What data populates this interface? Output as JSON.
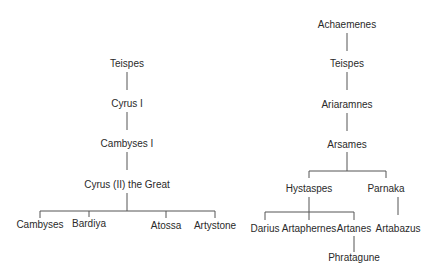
{
  "diagram": {
    "type": "family-tree",
    "left_tree": {
      "nodes": [
        {
          "id": "teispes_l",
          "label": "Teispes",
          "x": 127,
          "y": 64
        },
        {
          "id": "cyrus1",
          "label": "Cyrus I",
          "x": 127,
          "y": 104
        },
        {
          "id": "cambyses1",
          "label": "Cambyses I",
          "x": 127,
          "y": 144
        },
        {
          "id": "cyrus2",
          "label": "Cyrus (II) the Great",
          "x": 127,
          "y": 185
        },
        {
          "id": "cambyses",
          "label": "Cambyses",
          "x": 40,
          "y": 225
        },
        {
          "id": "bardiya",
          "label": "Bardiya",
          "x": 89,
          "y": 224
        },
        {
          "id": "atossa",
          "label": "Atossa",
          "x": 166,
          "y": 226
        },
        {
          "id": "artystone",
          "label": "Artystone",
          "x": 215,
          "y": 226
        }
      ]
    },
    "right_tree": {
      "nodes": [
        {
          "id": "achaemenes",
          "label": "Achaemenes",
          "x": 347,
          "y": 25
        },
        {
          "id": "teispes_r",
          "label": "Teispes",
          "x": 347,
          "y": 64
        },
        {
          "id": "ariaramnes",
          "label": "Ariaramnes",
          "x": 347,
          "y": 105
        },
        {
          "id": "arsames",
          "label": "Arsames",
          "x": 347,
          "y": 145
        },
        {
          "id": "hystaspes",
          "label": "Hystaspes",
          "x": 309,
          "y": 189
        },
        {
          "id": "parnaka",
          "label": "Parnaka",
          "x": 386,
          "y": 189
        },
        {
          "id": "darius",
          "label": "Darius",
          "x": 265,
          "y": 229
        },
        {
          "id": "artaphernes",
          "label": "Artaphernes",
          "x": 309,
          "y": 229
        },
        {
          "id": "artanes",
          "label": "Artanes",
          "x": 354,
          "y": 229
        },
        {
          "id": "artabazus",
          "label": "Artabazus",
          "x": 398,
          "y": 229
        },
        {
          "id": "phratagune",
          "label": "Phratagune",
          "x": 354,
          "y": 258
        }
      ]
    },
    "edges": [
      {
        "from": "teispes_l",
        "to": "cyrus1"
      },
      {
        "from": "cyrus1",
        "to": "cambyses1"
      },
      {
        "from": "cambyses1",
        "to": "cyrus2"
      },
      {
        "from": "cyrus2",
        "to": "cambyses"
      },
      {
        "from": "cyrus2",
        "to": "bardiya"
      },
      {
        "from": "cyrus2",
        "to": "atossa"
      },
      {
        "from": "cyrus2",
        "to": "artystone"
      },
      {
        "from": "achaemenes",
        "to": "teispes_r"
      },
      {
        "from": "teispes_r",
        "to": "ariaramnes"
      },
      {
        "from": "ariaramnes",
        "to": "arsames"
      },
      {
        "from": "arsames",
        "to": "hystaspes"
      },
      {
        "from": "arsames",
        "to": "parnaka"
      },
      {
        "from": "hystaspes",
        "to": "darius"
      },
      {
        "from": "hystaspes",
        "to": "artaphernes"
      },
      {
        "from": "hystaspes",
        "to": "artanes"
      },
      {
        "from": "parnaka",
        "to": "artabazus"
      },
      {
        "from": "artanes",
        "to": "phratagune"
      }
    ],
    "line_color": "#555555",
    "text_color": "#2a2a2a"
  }
}
